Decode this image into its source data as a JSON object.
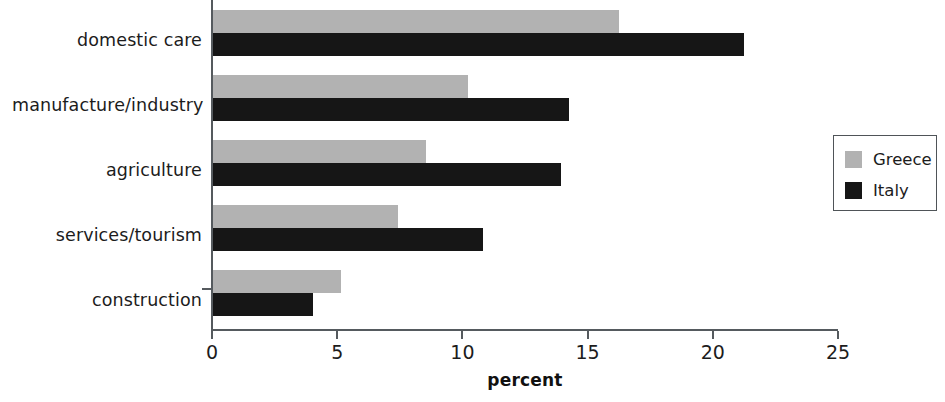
{
  "chart_data": {
    "type": "bar",
    "orientation": "horizontal",
    "title": "",
    "xlabel": "percent",
    "ylabel": "",
    "categories": [
      "domestic care",
      "manufacture/industry",
      "agriculture",
      "services/tourism",
      "construction"
    ],
    "series": [
      {
        "name": "Greece",
        "color": "#b2b2b2",
        "values": [
          16.2,
          10.2,
          8.5,
          7.4,
          5.1
        ]
      },
      {
        "name": "Italy",
        "color": "#161616",
        "values": [
          21.2,
          14.2,
          13.9,
          10.8,
          4.0
        ]
      }
    ],
    "xlim": [
      0,
      25
    ],
    "xticks": [
      0,
      5,
      10,
      15,
      20,
      25
    ],
    "xtick_labels": [
      "0",
      "5",
      "10",
      "15",
      "20",
      "25"
    ],
    "grid": false,
    "legend_position": "right"
  },
  "legend": {
    "entries": [
      {
        "label": "Greece",
        "swatch": "greece-swatch"
      },
      {
        "label": "Italy",
        "swatch": "italy-swatch"
      }
    ]
  }
}
